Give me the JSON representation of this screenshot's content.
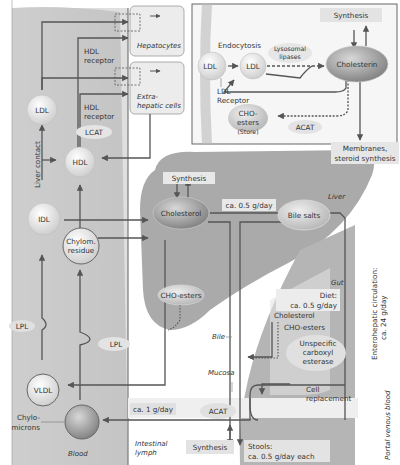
{
  "colors": {
    "blood_band": "#c9c9c9",
    "liver": "#a8a8a8",
    "gut": "#b3b3b3",
    "cell_box": "#ececec",
    "line": "#555555",
    "node_light": "#e6e6e6",
    "node_dark": "#9a9a9a",
    "label_box": "#e3e3e3"
  },
  "cell_inset": {
    "synthesis": "Synthesis",
    "endocytosis": "Endocytosis",
    "ldl_outer": "LDL",
    "ldl_inner": "LDL",
    "lysosomal_lipases": [
      "Lysosomal",
      "lipases"
    ],
    "cholesterin": "Cholesterin",
    "ldl_receptor": [
      "LDL",
      "Receptor"
    ],
    "cho_esters": [
      "CHO-",
      "esters"
    ],
    "store": "(Store)",
    "acat": "ACAT",
    "membranes": [
      "Membranes,",
      "steroid synthesis"
    ]
  },
  "blood_side": {
    "hepatocytes": "Hepatocytes",
    "extrahepatic": [
      "Extra-",
      "hepatic cells"
    ],
    "hdl_receptor_1": [
      "HDL",
      "receptor"
    ],
    "hdl_receptor_2": [
      "HDL",
      "receptor"
    ],
    "lcat": "LCAT",
    "ldl": "LDL",
    "hdl": "HDL",
    "liver_contact": "Liver contact",
    "idl": "IDL",
    "chylom_residue": [
      "Chylom.",
      "residue"
    ],
    "lpl_1": "LPL",
    "lpl_2": "LPL",
    "vldl": "VLDL",
    "chylomicrons": [
      "Chylo-",
      "microns"
    ],
    "blood": "Blood",
    "intestinal_lymph": [
      "Intestinal",
      "lymph"
    ]
  },
  "liver": {
    "label": "Liver",
    "synthesis": "Synthesis",
    "cholesterol": "Cholesterol",
    "flow_rate": "ca. 0.5 g/day",
    "bile_salts": "Bile salts",
    "cho_esters": "CHO-esters",
    "bile": "Bile"
  },
  "gut": {
    "label": "Gut",
    "diet": [
      "Diet:",
      "ca. 0.5 g/day"
    ],
    "cholesterol": "Cholesterol",
    "cho_esters": "CHO-esters",
    "esterase": [
      "Unspecific",
      "carboxyl",
      "esterase"
    ],
    "cell_replacement": [
      "Cell",
      "replacement"
    ],
    "mucosa": "Mucosa",
    "lymph_rate": "ca. 1 g/day",
    "acat": "ACAT",
    "synthesis": "Synthesis",
    "stools": [
      "Stools:",
      "ca. 0.5 g/day each"
    ]
  },
  "side_labels": {
    "enterohepatic": [
      "Enterohepatic circulation:",
      "ca. 24 g/day"
    ],
    "portal": "Portal venous blood"
  }
}
